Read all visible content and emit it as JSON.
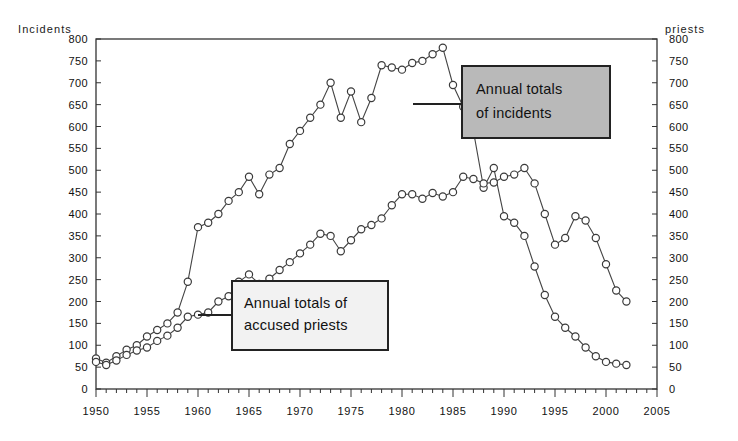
{
  "chart_data": {
    "type": "line",
    "title": "",
    "xlabel": "",
    "ylabel": "Incidents",
    "y2label": "priests",
    "grid": false,
    "legend_position": "annotations",
    "xlim": [
      1950,
      2005
    ],
    "ylim": [
      0,
      800
    ],
    "y2lim": [
      0,
      800
    ],
    "xticks": [
      1950,
      1955,
      1960,
      1965,
      1970,
      1975,
      1980,
      1985,
      1990,
      1995,
      2000,
      2005
    ],
    "xtick_labels": [
      "1950",
      "1955",
      "1960",
      "1965",
      "1970",
      "1975",
      "1980",
      "1985",
      "1990",
      "1995",
      "2000",
      "2005"
    ],
    "yticks": [
      0,
      50,
      100,
      150,
      200,
      250,
      300,
      350,
      400,
      450,
      500,
      550,
      600,
      650,
      700,
      750,
      800
    ],
    "ytick_labels": [
      "0",
      "50",
      "100",
      "150",
      "200",
      "250",
      "300",
      "350",
      "400",
      "450",
      "500",
      "550",
      "600",
      "650",
      "700",
      "750",
      "800"
    ],
    "y2ticks": [
      0,
      50,
      100,
      150,
      200,
      250,
      300,
      350,
      400,
      450,
      500,
      550,
      600,
      650,
      700,
      750,
      800
    ],
    "y2tick_labels": [
      "0",
      "50",
      "100",
      "150",
      "200",
      "250",
      "300",
      "350",
      "400",
      "450",
      "500",
      "550",
      "600",
      "650",
      "700",
      "750",
      "800"
    ],
    "minor_xtick_interval": 1,
    "x": [
      1950,
      1951,
      1952,
      1953,
      1954,
      1955,
      1956,
      1957,
      1958,
      1959,
      1960,
      1961,
      1962,
      1963,
      1964,
      1965,
      1966,
      1967,
      1968,
      1969,
      1970,
      1971,
      1972,
      1973,
      1974,
      1975,
      1976,
      1977,
      1978,
      1979,
      1980,
      1981,
      1982,
      1983,
      1984,
      1985,
      1986,
      1987,
      1988,
      1989,
      1990,
      1991,
      1992,
      1993,
      1994,
      1995,
      1996,
      1997,
      1998,
      1999,
      2000,
      2001,
      2002
    ],
    "series": [
      {
        "name": "Annual totals of incidents",
        "marker": "circle-open",
        "values": [
          70,
          60,
          75,
          90,
          100,
          120,
          135,
          150,
          175,
          245,
          370,
          380,
          400,
          430,
          450,
          485,
          445,
          490,
          505,
          560,
          590,
          620,
          650,
          700,
          620,
          680,
          610,
          665,
          740,
          735,
          730,
          745,
          750,
          765,
          780,
          695,
          645,
          590,
          460,
          505,
          395,
          380,
          350,
          280,
          215,
          165,
          140,
          120,
          95,
          75,
          62,
          58,
          55
        ]
      },
      {
        "name": "Annual totals of accused priests",
        "marker": "circle-open",
        "values": [
          62,
          55,
          65,
          78,
          88,
          95,
          110,
          122,
          140,
          165,
          170,
          175,
          200,
          212,
          245,
          262,
          240,
          252,
          272,
          290,
          310,
          330,
          355,
          350,
          315,
          340,
          365,
          375,
          390,
          420,
          445,
          445,
          435,
          448,
          440,
          450,
          485,
          480,
          470,
          472,
          485,
          490,
          505,
          470,
          400,
          330,
          345,
          395,
          385,
          345,
          285,
          225,
          200
        ]
      }
    ],
    "annotations": [
      {
        "id": "incidents-callout",
        "text_lines": [
          "Annual totals",
          "of incidents"
        ],
        "fill_color": "#b9b9b9",
        "border_color": "#222222"
      },
      {
        "id": "priests-callout",
        "text_lines": [
          "Annual totals of",
          "accused priests"
        ],
        "fill_color": "#f2f2f2",
        "border_color": "#222222"
      }
    ]
  },
  "axes": {
    "left_title": "Incidents",
    "right_title": "priests"
  },
  "annotation_text": {
    "incidents_line1": "Annual totals",
    "incidents_line2": "of incidents",
    "priests_line1": "Annual totals of",
    "priests_line2": "accused priests"
  }
}
